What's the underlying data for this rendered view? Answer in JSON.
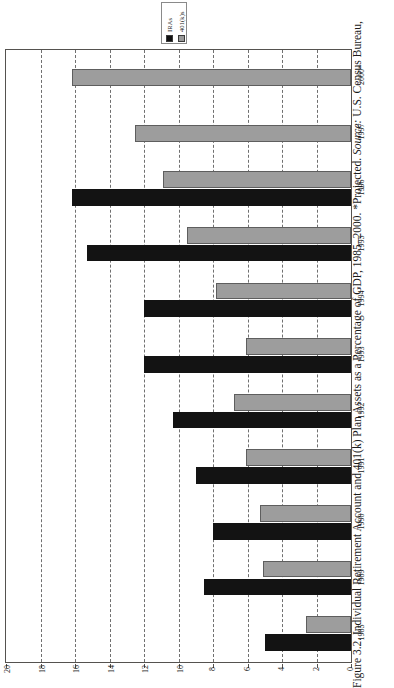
{
  "figure": {
    "caption_full": "Figure 3.2. Individual Retirement Account and 401(k) Plan Assets as a Percentage of GDP, 1985–2000. *Projected. Source: U.S. Census Bureau,",
    "caption_label": "Figure 3.2.",
    "caption_title": "Individual Retirement Account and 401(k) Plan Assets as a Percentage of GDP, 1985–2000.",
    "caption_note": "*Projected.",
    "caption_source_label": "Source:",
    "caption_source_value": "U.S. Census Bureau,",
    "orientation": "rotated-90-sideways-page"
  },
  "legend": {
    "entries": [
      {
        "label": "IRAs",
        "color": "#131313",
        "swatch": "iras"
      },
      {
        "label": "401(k)s",
        "color": "#9d9d9d",
        "swatch": "k401"
      }
    ]
  },
  "axis": {
    "value_ticks": [
      "20",
      "18",
      "16",
      "14",
      "12",
      "10",
      "8",
      "6",
      "4",
      "2",
      "0"
    ],
    "value_tick_numbers": [
      20,
      18,
      16,
      14,
      12,
      10,
      8,
      6,
      4,
      2,
      0
    ],
    "value_min": 0,
    "value_max": 20,
    "direction": "right-to-left (0 at right)"
  },
  "chart_data": {
    "type": "bar",
    "title": "Individual Retirement Account and 401(k) Plan Assets as a Percentage of GDP, 1985–2000",
    "subtitle": "*Projected. Source: U.S. Census Bureau,",
    "xlabel": "",
    "ylabel": "Percentage of GDP",
    "ylim": [
      0,
      20
    ],
    "grid": true,
    "legend_position": "top",
    "orientation": "horizontal",
    "categories": [
      "2000*",
      "1997",
      "1996",
      "1995",
      "1994",
      "1993",
      "1992",
      "1991",
      "1990",
      "1989",
      "1985"
    ],
    "series": [
      {
        "name": "IRAs",
        "color": "#131313",
        "values": [
          null,
          null,
          16.2,
          15.3,
          12.0,
          12.0,
          10.3,
          9.0,
          8.0,
          8.5,
          5.0
        ]
      },
      {
        "name": "401(k)s",
        "color": "#9d9d9d",
        "values": [
          16.2,
          12.5,
          10.9,
          9.5,
          7.8,
          6.1,
          6.8,
          6.1,
          5.3,
          5.1,
          2.6
        ]
      }
    ]
  },
  "colors": {
    "iras": "#131313",
    "k401": "#9d9d9d",
    "frame": "#55524f",
    "grid": "#707070",
    "background": "#ffffff"
  }
}
